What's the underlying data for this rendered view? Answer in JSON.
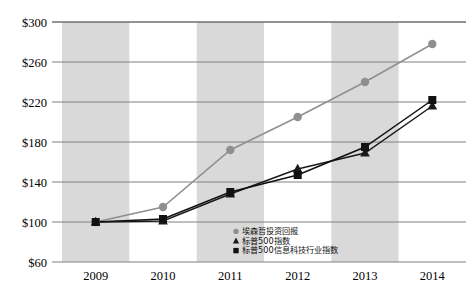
{
  "chart_data": {
    "type": "line",
    "title": "",
    "xlabel": "",
    "ylabel": "",
    "categories": [
      "2009",
      "2010",
      "2011",
      "2012",
      "2013",
      "2014"
    ],
    "ylim": [
      60,
      300
    ],
    "yticks": [
      "$60",
      "$100",
      "$140",
      "$180",
      "$220",
      "$260",
      "$300"
    ],
    "ytick_values": [
      60,
      100,
      140,
      180,
      220,
      260,
      300
    ],
    "grid": true,
    "legend_position": "bottom-right",
    "series": [
      {
        "name": "埃森哲投资回报",
        "marker": "circle",
        "color": "#8f8f8f",
        "values": [
          100,
          115,
          172,
          205,
          240,
          278
        ]
      },
      {
        "name": "标普500指数",
        "marker": "triangle",
        "color": "#1a1a1a",
        "values": [
          100,
          101,
          128,
          153,
          169,
          216
        ]
      },
      {
        "name": "标普500信息科技行业指数",
        "marker": "square",
        "color": "#111111",
        "values": [
          100,
          103,
          130,
          147,
          175,
          222
        ]
      }
    ]
  },
  "legend": {
    "items": [
      {
        "label": "埃森哲投资回报",
        "marker": "circle-marker"
      },
      {
        "label": "标普500指数",
        "marker": "triangle-marker"
      },
      {
        "label": "标普500信息科技行业指数",
        "marker": "square-marker"
      }
    ]
  },
  "style": {
    "band_color": "#d9d9d9",
    "grid_color": "#808080",
    "axis_color": "#666666",
    "plot_bg": "#ffffff"
  }
}
